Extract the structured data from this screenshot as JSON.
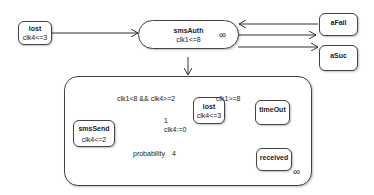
{
  "diagram": {
    "type": "state-machine",
    "states": {
      "lost_top": {
        "name": "lost",
        "invariant": "clk4<=3"
      },
      "smsAuth": {
        "name": "smsAuth",
        "invariant": "clk1<=8",
        "symbol": "∞"
      },
      "aFail": {
        "name": "aFail"
      },
      "aSuc": {
        "name": "aSuc"
      },
      "smsSend": {
        "name": "smsSend",
        "invariant": "clk4<=2"
      },
      "lost_inner": {
        "name": "lost",
        "invariant": "clk4<=3"
      },
      "timeOut": {
        "name": "timeOut"
      },
      "received": {
        "name": "received"
      }
    },
    "composite": {
      "symbol": "∞"
    },
    "labels": {
      "loop_guard": "clk1<8 && clk4>=2",
      "timeout_guard": "clk1>=8",
      "prob_weight_1": "1",
      "prob_reset": "clk4:=0",
      "prob_weight_4": "4",
      "probability": "probability"
    }
  }
}
